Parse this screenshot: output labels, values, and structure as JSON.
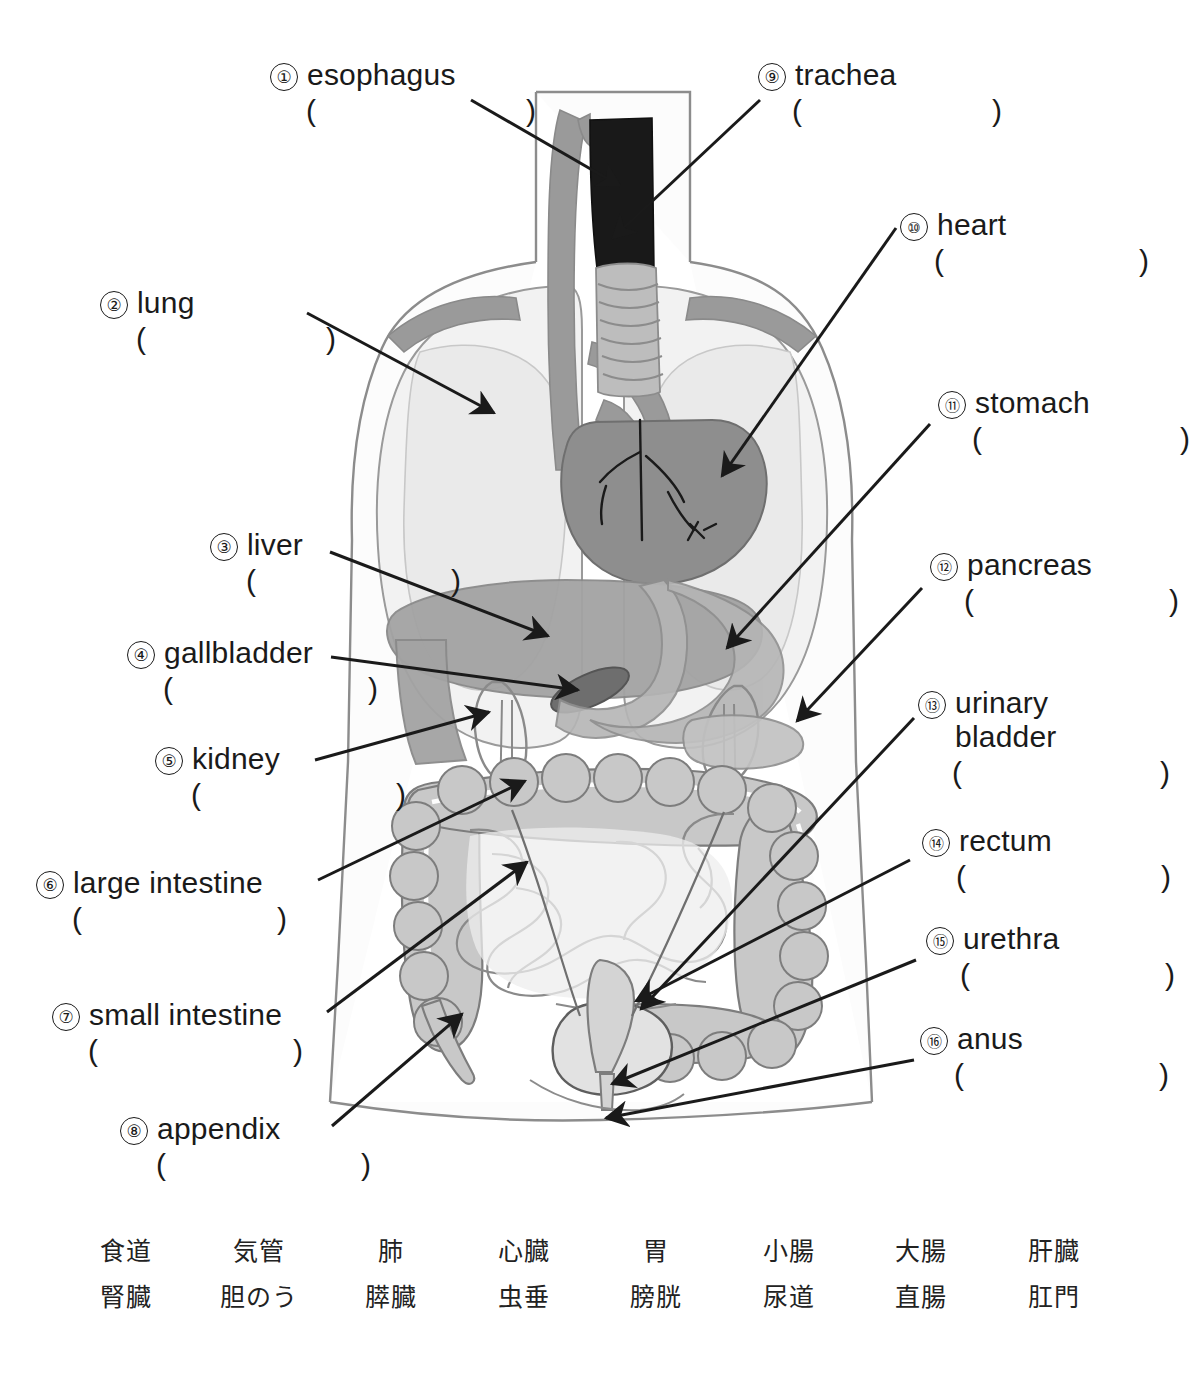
{
  "worksheet": {
    "labels_left": [
      {
        "num": "①",
        "term": "esophagus",
        "left": 270,
        "top": 58,
        "answer_width": 230,
        "line2": ""
      },
      {
        "num": "②",
        "term": "lung",
        "left": 100,
        "top": 286,
        "answer_width": 200,
        "line2": ""
      },
      {
        "num": "③",
        "term": "liver",
        "left": 210,
        "top": 528,
        "answer_width": 215,
        "line2": ""
      },
      {
        "num": "④",
        "term": "gallbladder",
        "left": 127,
        "top": 636,
        "answer_width": 215,
        "line2": ""
      },
      {
        "num": "⑤",
        "term": "kidney",
        "left": 155,
        "top": 742,
        "answer_width": 215,
        "line2": ""
      },
      {
        "num": "⑥",
        "term": "large intestine",
        "left": 36,
        "top": 866,
        "answer_width": 215,
        "line2": ""
      },
      {
        "num": "⑦",
        "term": "small intestine",
        "left": 52,
        "top": 998,
        "answer_width": 215,
        "line2": ""
      },
      {
        "num": "⑧",
        "term": "appendix",
        "left": 120,
        "top": 1112,
        "answer_width": 215,
        "line2": ""
      }
    ],
    "labels_right": [
      {
        "num": "⑨",
        "term": "trachea",
        "left": 758,
        "top": 58,
        "answer_width": 210,
        "line2": ""
      },
      {
        "num": "⑩",
        "term": "heart",
        "left": 900,
        "top": 208,
        "answer_width": 215,
        "line2": ""
      },
      {
        "num": "⑪",
        "term": "stomach",
        "left": 938,
        "top": 386,
        "answer_width": 218,
        "line2": ""
      },
      {
        "num": "⑫",
        "term": "pancreas",
        "left": 930,
        "top": 548,
        "answer_width": 215,
        "line2": ""
      },
      {
        "num": "⑬",
        "term": "urinary",
        "left": 918,
        "top": 686,
        "answer_width": 218,
        "line2": "bladder"
      },
      {
        "num": "⑭",
        "term": "rectum",
        "left": 922,
        "top": 824,
        "answer_width": 215,
        "line2": ""
      },
      {
        "num": "⑮",
        "term": "urethra",
        "left": 926,
        "top": 922,
        "answer_width": 215,
        "line2": ""
      },
      {
        "num": "⑯",
        "term": "anus",
        "left": 920,
        "top": 1022,
        "answer_width": 215,
        "line2": ""
      }
    ],
    "answer_open": "(",
    "answer_close": ")",
    "word_bank": {
      "row1": [
        "食道",
        "気管",
        "肺",
        "心臓",
        "胃",
        "小腸",
        "大腸",
        "肝臓"
      ],
      "row2": [
        "腎臓",
        "胆のう",
        "膵臓",
        "虫垂",
        "膀胱",
        "尿道",
        "直腸",
        "肛門"
      ]
    }
  },
  "figure": {
    "colors": {
      "outline": "#8c8c8c",
      "body_fill": "#fcfcfc",
      "lung": "#f2f2f2",
      "lung_inner": "#e9e9e9",
      "heart": "#8e8e8e",
      "vessel": "#9a9a9a",
      "esophagus_dark": "#1a1a1a",
      "trachea": "#b8b8b8",
      "liver": "#a3a3a3",
      "gallbladder": "#6e6e6e",
      "stomach": "#b5b5b5",
      "intestine": "#c8c8c8",
      "intestine_line": "#7d7d7d",
      "kidney": "#b0b0b0",
      "bladder": "#d4d4d4",
      "leader": "#1a1a1a"
    },
    "organ_names": [
      "esophagus",
      "trachea",
      "lung-left",
      "lung-right",
      "heart",
      "liver",
      "gallbladder",
      "stomach",
      "pancreas",
      "kidney",
      "large-intestine",
      "small-intestine",
      "appendix",
      "urinary-bladder",
      "rectum",
      "urethra",
      "anus"
    ]
  }
}
